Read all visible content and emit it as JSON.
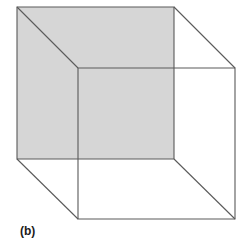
{
  "figure": {
    "caption": "(b)",
    "kind": "necker-cube",
    "canvas": {
      "width": 249,
      "height": 239,
      "background": "#ffffff"
    },
    "style": {
      "line_color": "#5a5a5a",
      "line_width": 1.1,
      "shaded_face_fill": "#d6d6d6",
      "caption_color": "#1b1b1b"
    },
    "vertices": {
      "back_top_left": [
        17,
        7
      ],
      "back_top_right": [
        174,
        7
      ],
      "back_bottom_right": [
        174,
        159
      ],
      "back_bottom_left": [
        17,
        159
      ],
      "front_top_left": [
        78,
        68
      ],
      "front_top_right": [
        235,
        68
      ],
      "front_bottom_right": [
        235,
        219
      ],
      "front_bottom_left": [
        78,
        219
      ]
    },
    "shaded_face": {
      "name": "back-face",
      "fill": "#d6d6d6",
      "points": "17,7 174,7 174,159 17,159"
    },
    "faces": [
      {
        "name": "back-face-square",
        "points": "17,7 174,7 174,159 17,159"
      },
      {
        "name": "front-face-square",
        "points": "78,68 235,68 235,219 78,219"
      }
    ],
    "connectors": [
      {
        "name": "edge-top-left",
        "x1": 17,
        "y1": 7,
        "x2": 78,
        "y2": 68
      },
      {
        "name": "edge-top-right",
        "x1": 174,
        "y1": 7,
        "x2": 235,
        "y2": 68
      },
      {
        "name": "edge-bottom-left",
        "x1": 17,
        "y1": 159,
        "x2": 78,
        "y2": 219
      },
      {
        "name": "edge-bottom-right",
        "x1": 174,
        "y1": 159,
        "x2": 235,
        "y2": 219
      }
    ]
  }
}
